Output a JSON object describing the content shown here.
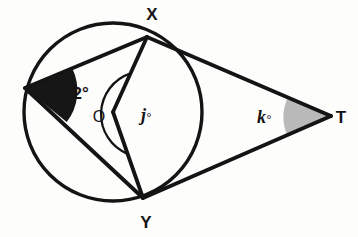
{
  "figure": {
    "background_color": "#fdfdfc",
    "stroke_color": "#141414"
  },
  "points": {
    "x": {
      "label": "X",
      "cx": 147,
      "cy": 37,
      "label_x": 152,
      "label_y": 20
    },
    "y": {
      "label": "Y",
      "cx": 143,
      "cy": 198,
      "label_x": 139,
      "label_y": 225
    },
    "t": {
      "label": "T",
      "cx": 331,
      "cy": 116,
      "label_x": 338,
      "label_y": 124
    },
    "o": {
      "label": "O",
      "cx": 113,
      "cy": 112,
      "label_x": 92,
      "label_y": 122
    },
    "z": {
      "label": "",
      "cx": 25,
      "cy": 88
    }
  },
  "circle": {
    "cx": 113,
    "cy": 112,
    "r": 89
  },
  "angles": {
    "inscribed": {
      "label": "72°",
      "value": 72,
      "vertex": "Z",
      "fill": "#161616",
      "label_x": 57,
      "label_y": 101
    },
    "central": {
      "label": "j",
      "degree_symbol": "°",
      "value": null,
      "vertex": "O",
      "fill": "none",
      "label_x": 143,
      "label_y": 122
    },
    "external": {
      "label": "k",
      "degree_symbol": "°",
      "value": null,
      "vertex": "T",
      "fill": "#b9b9b9",
      "label_x": 258,
      "label_y": 123
    }
  },
  "segments": [
    {
      "name": "chord-zx",
      "from": "Z",
      "to": "X"
    },
    {
      "name": "chord-zy",
      "from": "Z",
      "to": "Y"
    },
    {
      "name": "radius-ox",
      "from": "O",
      "to": "X"
    },
    {
      "name": "radius-oy",
      "from": "O",
      "to": "Y"
    },
    {
      "name": "tangent-xt",
      "from": "X",
      "to": "T"
    },
    {
      "name": "tangent-yt",
      "from": "Y",
      "to": "T"
    }
  ]
}
